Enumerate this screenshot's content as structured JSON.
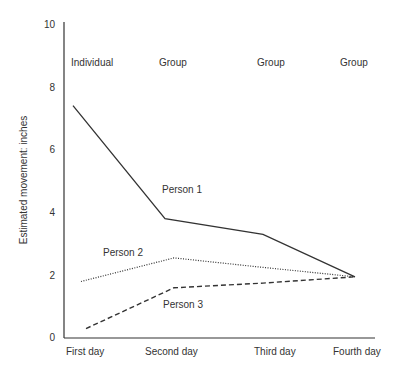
{
  "chart_data": {
    "type": "line",
    "title": "",
    "xlabel": "",
    "ylabel": "Estimated movement: inches",
    "ylim": [
      0,
      10
    ],
    "yticks": [
      0,
      2,
      4,
      6,
      8,
      10
    ],
    "grid": false,
    "categories": [
      "First day",
      "Second day",
      "Third day",
      "Fourth day"
    ],
    "condition_labels": [
      "Individual",
      "Group",
      "Group",
      "Group"
    ],
    "series": [
      {
        "name": "Person 1",
        "style": "solid",
        "values": [
          7.4,
          3.8,
          3.3,
          1.95
        ]
      },
      {
        "name": "Person 2",
        "style": "dotted",
        "values": [
          1.8,
          2.55,
          2.25,
          1.95
        ]
      },
      {
        "name": "Person 3",
        "style": "dashed",
        "values": [
          0.3,
          1.6,
          1.75,
          1.95
        ]
      }
    ],
    "legend": "inline labels near lines"
  },
  "colors": {
    "line": "#333333",
    "text": "#333333",
    "background": "#ffffff"
  }
}
